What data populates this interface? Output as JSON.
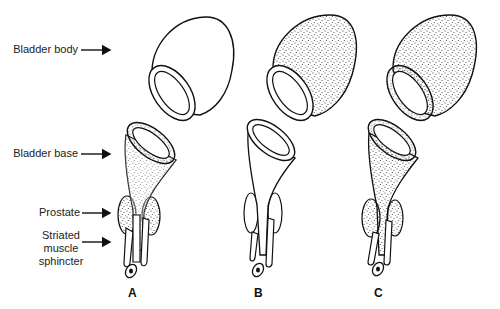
{
  "labels": {
    "bladder_body": "Bladder body",
    "bladder_base": "Bladder base",
    "prostate": "Prostate",
    "striated_line1": "Striated",
    "striated_line2": "muscle",
    "striated_line3": "sphincter"
  },
  "panels": [
    {
      "letter": "A",
      "body_stippled": false,
      "base_stippled": true
    },
    {
      "letter": "B",
      "body_stippled": true,
      "base_stippled": false
    },
    {
      "letter": "C",
      "body_stippled": true,
      "base_stippled": true
    }
  ],
  "colors": {
    "ink": "#111111",
    "background": "#ffffff"
  }
}
